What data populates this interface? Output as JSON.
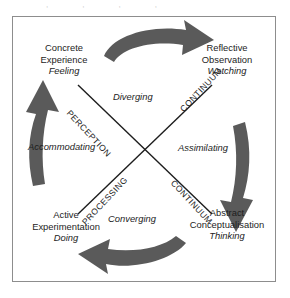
{
  "diagram": {
    "top_smudge": ",,,,",
    "frame_color": "#8d8d8d",
    "arrow_color": "#5a5a5a",
    "line_color": "#1d1d1d",
    "text_color": "#1d1d1d",
    "stages": [
      {
        "id": "concrete-experience",
        "position": "top-left",
        "line1": "Concrete",
        "line2": "Experience",
        "verb": "Feeling"
      },
      {
        "id": "reflective-observation",
        "position": "top-right",
        "line1": "Reflective",
        "line2": "Observation",
        "verb": "Watching"
      },
      {
        "id": "active-experimentation",
        "position": "bottom-left",
        "line1": "Active",
        "line2": "Experimentation",
        "verb": "Doing"
      },
      {
        "id": "abstract-conceptualisation",
        "position": "bottom-right",
        "line1": "Abstract",
        "line2": "Conceptualisation",
        "verb": "Thinking"
      }
    ],
    "learning_styles": [
      {
        "id": "diverging",
        "label": "Diverging",
        "position": "top"
      },
      {
        "id": "assimilating",
        "label": "Assimilating",
        "position": "right"
      },
      {
        "id": "converging",
        "label": "Converging",
        "position": "bottom"
      },
      {
        "id": "accommodating",
        "label": "Accommodating",
        "position": "left"
      }
    ],
    "axes": [
      {
        "id": "perception-continuum",
        "word1": "PERCEPTION",
        "word2": "CONTINUUM",
        "direction": "top-left-to-bottom-right"
      },
      {
        "id": "processing-continuum",
        "word1": "PROCESSING",
        "word2": "CONTINUUM",
        "direction": "bottom-left-to-top-right"
      }
    ],
    "arrows": [
      {
        "id": "arrow-top",
        "direction": "right",
        "label": "top-arrow-pointing-right"
      },
      {
        "id": "arrow-right",
        "direction": "down",
        "label": "right-arrow-pointing-down"
      },
      {
        "id": "arrow-bottom",
        "direction": "left",
        "label": "bottom-arrow-pointing-left"
      },
      {
        "id": "arrow-left",
        "direction": "up",
        "label": "left-arrow-pointing-up"
      }
    ]
  }
}
